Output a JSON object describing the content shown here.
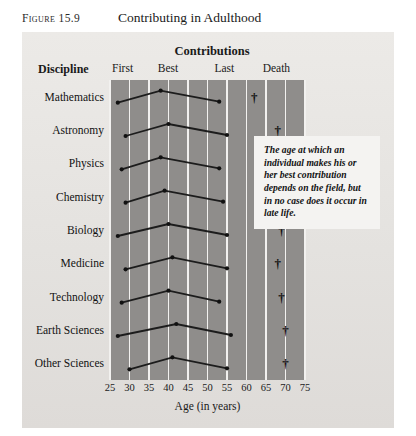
{
  "figure": {
    "number": "Figure 15.9",
    "title": "Contributing in Adulthood"
  },
  "headers": {
    "contributions": "Contributions",
    "discipline": "Discipline",
    "columns": [
      "First",
      "Best",
      "Last",
      "Death"
    ]
  },
  "axis": {
    "label": "Age (in years)",
    "ticks": [
      "25",
      "30",
      "35",
      "40",
      "45",
      "50",
      "55",
      "60",
      "65",
      "70",
      "75"
    ]
  },
  "annotation": {
    "text": "The age at which an individual makes his or her best contribution depends on the field, but in no case does it occur in late life."
  },
  "colors": {
    "panel": "#e6e4e1",
    "plot": "#8f8d8b",
    "gridline": "#f2f1ef",
    "line": "#1c1c1c",
    "marker": "#111111",
    "annotation_bg": "#f4f3f1"
  },
  "chart_data": {
    "type": "line",
    "title": "Contributing in Adulthood",
    "xlabel": "Age (in years)",
    "ylabel": "Discipline",
    "xlim": [
      25,
      75
    ],
    "xticks": [
      25,
      30,
      35,
      40,
      45,
      50,
      55,
      60,
      65,
      70,
      75
    ],
    "grid": true,
    "legend": "none",
    "series_names": [
      "First",
      "Best",
      "Last",
      "Death"
    ],
    "categories": [
      "Mathematics",
      "Astronomy",
      "Physics",
      "Chemistry",
      "Biology",
      "Medicine",
      "Technology",
      "Earth Sciences",
      "Other Sciences"
    ],
    "rows": [
      {
        "discipline": "Mathematics",
        "first": 27,
        "best": 38,
        "last": 53,
        "death": 62
      },
      {
        "discipline": "Astronomy",
        "first": 29,
        "best": 40,
        "last": 55,
        "death": 68
      },
      {
        "discipline": "Physics",
        "first": 28,
        "best": 38,
        "last": 53,
        "death": 66
      },
      {
        "discipline": "Chemistry",
        "first": 29,
        "best": 39,
        "last": 54,
        "death": 67
      },
      {
        "discipline": "Biology",
        "first": 27,
        "best": 40,
        "last": 55,
        "death": 69
      },
      {
        "discipline": "Medicine",
        "first": 29,
        "best": 41,
        "last": 55,
        "death": 68
      },
      {
        "discipline": "Technology",
        "first": 28,
        "best": 40,
        "last": 53,
        "death": 69
      },
      {
        "discipline": "Earth Sciences",
        "first": 27,
        "best": 42,
        "last": 56,
        "death": 70
      },
      {
        "discipline": "Other Sciences",
        "first": 30,
        "best": 41,
        "last": 55,
        "death": 70
      }
    ]
  }
}
